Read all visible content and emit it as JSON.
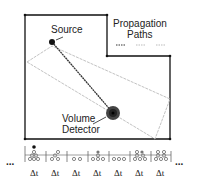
{
  "labels": {
    "source": "Source",
    "legend_line1": "Propagation",
    "legend_line2": "Paths",
    "detector_line1": "Volume",
    "detector_line2": "Detector",
    "ellipsis": "...",
    "bin_label": "Δt"
  },
  "colors": {
    "wall": "#111111",
    "path_gray": "#bbbbbb",
    "direct_path": "#333333"
  },
  "timeline": {
    "bins": [
      {
        "label": "Δt"
      },
      {
        "label": "Δt"
      },
      {
        "label": "Δt"
      },
      {
        "label": "Δt"
      },
      {
        "label": "Δt"
      },
      {
        "label": "Δt"
      },
      {
        "label": "Δt"
      }
    ]
  }
}
